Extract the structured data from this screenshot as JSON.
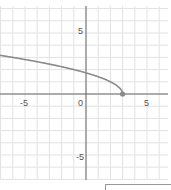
{
  "chart_data": {
    "type": "line",
    "title": "",
    "xlabel": "",
    "ylabel": "",
    "xlim": [
      -7,
      7
    ],
    "ylim": [
      -7.1,
      7.6
    ],
    "grid": true,
    "grid_step": 1,
    "x_ticks": [
      {
        "value": -5,
        "label": "-5"
      },
      {
        "value": 0,
        "label": "0"
      },
      {
        "value": 5,
        "label": "5"
      }
    ],
    "y_ticks": [
      {
        "value": 5,
        "label": "5"
      },
      {
        "value": -5,
        "label": "-5"
      }
    ],
    "series": [
      {
        "name": "y = sqrt(3 - x)",
        "color": "#8a8a8a",
        "x": [
          -7,
          -6,
          -5,
          -4,
          -3,
          -2,
          -1,
          0,
          1,
          2,
          2.5,
          2.9,
          3
        ],
        "values": [
          3.16,
          3.0,
          2.83,
          2.65,
          2.45,
          2.24,
          2.0,
          1.73,
          1.41,
          1.0,
          0.71,
          0.32,
          0
        ]
      }
    ],
    "annotations": [
      {
        "type": "point",
        "x": 3,
        "y": 0,
        "style": "closed-dot",
        "color": "#8a8a8a"
      }
    ]
  },
  "labels": {
    "x_neg5": "-5",
    "x_0": "0",
    "x_5": "5",
    "y_5": "5",
    "y_neg5": "-5"
  },
  "colors": {
    "grid": "#e2e2e2",
    "axis": "#666666",
    "curve": "#8a8a8a"
  }
}
